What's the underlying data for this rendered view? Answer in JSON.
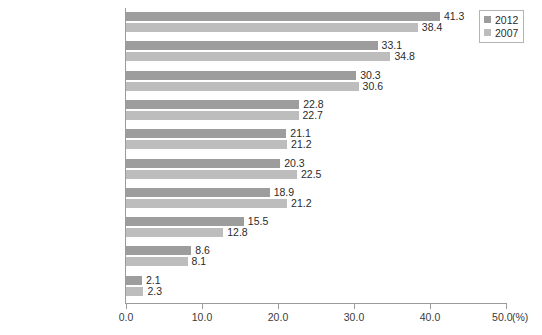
{
  "chart_data": {
    "type": "bar",
    "orientation": "horizontal",
    "title": "",
    "xlabel": "(%)",
    "ylabel": "",
    "xlim": [
      0,
      50
    ],
    "xticks": [
      "0.0",
      "10.0",
      "20.0",
      "30.0",
      "40.0",
      "50.0"
    ],
    "xtick_values": [
      0,
      10,
      20,
      30,
      40,
      50
    ],
    "axis_unit": "(%)",
    "grid": false,
    "legend_position": "top-right",
    "categories": [
      "職場の人間関係の問題",
      "仕事の質の問題",
      "仕事の量の問題",
      "会社の将来性の問題",
      "定年後の仕事, 老後の問題",
      "仕事への適性の問題",
      "昇進, 昇給の問題",
      "雇用の安定性の問題",
      "配置転換の問題",
      "事故や災害の経験"
    ],
    "series": [
      {
        "name": "2012",
        "color": "#9d9d9d",
        "values": [
          41.3,
          33.1,
          30.3,
          22.8,
          21.1,
          20.3,
          18.9,
          15.5,
          8.6,
          2.1
        ],
        "labels": [
          "41.3",
          "33.1",
          "30.3",
          "22.8",
          "21.1",
          "20.3",
          "18.9",
          "15.5",
          "8.6",
          "2.1"
        ]
      },
      {
        "name": "2007",
        "color": "#bdbdbd",
        "values": [
          38.4,
          34.8,
          30.6,
          22.7,
          21.2,
          22.5,
          21.2,
          12.8,
          8.1,
          2.3
        ],
        "labels": [
          "38.4",
          "34.8",
          "30.6",
          "22.7",
          "21.2",
          "22.5",
          "21.2",
          "12.8",
          "8.1",
          "2.3"
        ]
      }
    ]
  },
  "legend": {
    "items": [
      {
        "label": "2012",
        "color": "#9d9d9d"
      },
      {
        "label": "2007",
        "color": "#bdbdbd"
      }
    ]
  }
}
